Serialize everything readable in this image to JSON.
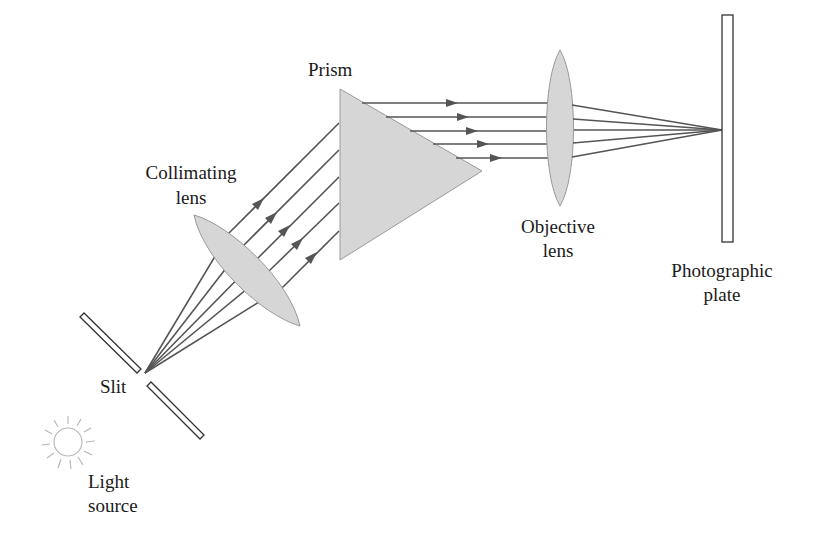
{
  "diagram": {
    "labels": {
      "prism": "Prism",
      "collimating_lens_line1": "Collimating",
      "collimating_lens_line2": "lens",
      "objective_lens_line1": "Objective",
      "objective_lens_line2": "lens",
      "photographic_plate_line1": "Photographic",
      "photographic_plate_line2": "plate",
      "slit": "Slit",
      "light_source_line1": "Light",
      "light_source_line2": "source"
    },
    "colors": {
      "ray": "#555555",
      "optic_fill": "#d6d6d6",
      "outline": "#333333",
      "text": "#1a1a1a"
    },
    "components": [
      "Light source",
      "Slit",
      "Collimating lens",
      "Prism",
      "Objective lens",
      "Photographic plate"
    ],
    "ray_count": 5
  }
}
